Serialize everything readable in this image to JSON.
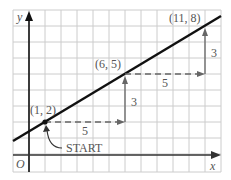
{
  "axes": {
    "x_label": "x",
    "y_label": "y",
    "origin_label": "O"
  },
  "points": [
    {
      "label": "(1, 2)",
      "x": 1,
      "y": 2
    },
    {
      "label": "(6, 5)",
      "x": 6,
      "y": 5
    },
    {
      "label": "(11, 8)",
      "x": 11,
      "y": 8
    }
  ],
  "steps": [
    {
      "run_label": "5",
      "rise_label": "3"
    },
    {
      "run_label": "5",
      "rise_label": "3"
    }
  ],
  "start_label": "START",
  "colors": {
    "grid": "#cccccc",
    "line": "#111111",
    "dashed": "#666666",
    "text": "#555555"
  }
}
